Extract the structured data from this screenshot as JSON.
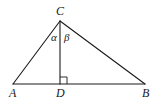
{
  "diagram": {
    "type": "right-triangle-with-altitude",
    "points": {
      "A": {
        "label": "A",
        "x": 13,
        "y": 84
      },
      "B": {
        "label": "B",
        "x": 145,
        "y": 84
      },
      "C": {
        "label": "C",
        "x": 60,
        "y": 21
      },
      "D": {
        "label": "D",
        "x": 60,
        "y": 84
      }
    },
    "angles": {
      "alpha": {
        "label": "α"
      },
      "beta": {
        "label": "β"
      }
    },
    "right_angle_marker": {
      "at": "D"
    },
    "colors": {
      "stroke": "#1a1a1a",
      "background": "#ffffff"
    }
  }
}
